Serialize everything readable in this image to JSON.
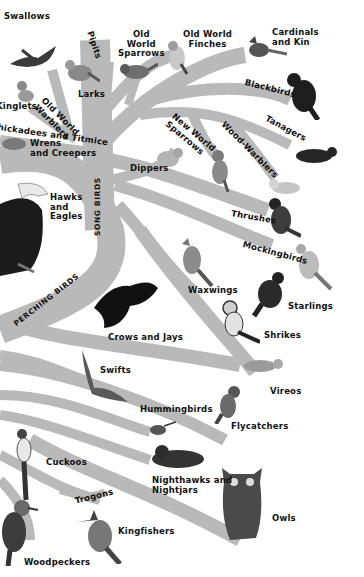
{
  "colors": {
    "background": "#ffffff",
    "branch": "#b9b9b9",
    "text": "#111111",
    "bird_dark": "#2a2a2a",
    "bird_mid": "#6b6b6b",
    "bird_light": "#d6d6d6"
  },
  "groups": {
    "song_birds": "SONG BIRDS",
    "perching_birds": "PERCHING BIRDS"
  },
  "labels": {
    "swallows": "Swallows",
    "pipits": "Pipits",
    "old_world_sparrows": "Old\nWorld\nSparrows",
    "old_world_finches": "Old World\nFinches",
    "cardinals": "Cardinals\nand Kin",
    "larks": "Larks",
    "kinglets": "Kinglets",
    "old_world_warblers": "Old World\nWarblers",
    "chickadees": "Chickadees and Titmice",
    "wrens": "Wrens\nand Creepers",
    "blackbirds": "Blackbirds",
    "tanagers": "Tanagers",
    "new_world_sparrows": "New World\nSparrows",
    "wood_warblers": "Wood-Warblers",
    "dippers": "Dippers",
    "hawks": "Hawks\nand\nEagles",
    "thrushes": "Thrushes",
    "mockingbirds": "Mockingbirds",
    "waxwings": "Waxwings",
    "starlings": "Starlings",
    "crows": "Crows and Jays",
    "shrikes": "Shrikes",
    "swifts": "Swifts",
    "vireos": "Vireos",
    "hummingbirds": "Hummingbirds",
    "flycatchers": "Flycatchers",
    "cuckoos": "Cuckoos",
    "nighthawks": "Nighthawks and\nNightjars",
    "trogons": "Trogons",
    "kingfishers": "Kingfishers",
    "owls": "Owls",
    "woodpeckers": "Woodpeckers"
  },
  "icons": {
    "swallow": "swallow-icon",
    "lark": "lark-icon",
    "sparrow": "sparrow-icon",
    "finch": "finch-icon",
    "cardinal": "cardinal-icon",
    "blackbird": "blackbird-icon",
    "tanager": "tanager-icon",
    "eagle": "eagle-icon",
    "owl": "owl-icon"
  }
}
